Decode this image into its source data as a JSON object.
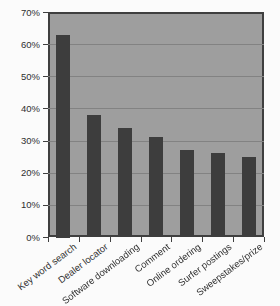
{
  "chart_data": {
    "type": "bar",
    "title": "",
    "xlabel": "",
    "ylabel": "",
    "categories": [
      "Key word search",
      "Dealer locator",
      "Software downloading",
      "Comment",
      "Online ordering",
      "Surfer postings",
      "Sweepstakes/prize"
    ],
    "values": [
      63,
      38,
      34,
      31,
      27,
      26,
      25
    ],
    "unit": "%",
    "ylim": [
      0,
      70
    ],
    "ytick_interval": 10,
    "ytick_labels": [
      "0%",
      "10%",
      "20%",
      "30%",
      "40%",
      "50%",
      "60%",
      "70%"
    ],
    "grid": true,
    "legend": false,
    "colors": {
      "bar": "#3d3d3d",
      "plot_background": "#9e9e9e",
      "gridline": "#828282",
      "plot_border": "#3f3f3f",
      "text": "#2f2f2f",
      "page_background": "#fbfbfb"
    }
  }
}
